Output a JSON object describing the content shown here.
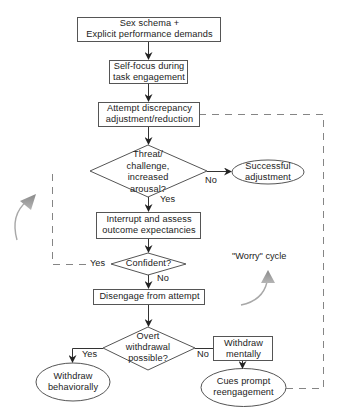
{
  "diagram": {
    "type": "flowchart",
    "colors": {
      "stroke": "#555555",
      "text": "#222222",
      "cycle_arrow": "#9a9a9a",
      "background": "#ffffff"
    },
    "nodes": {
      "sex_schema": {
        "shape": "rect",
        "lines": [
          "Sex schema +",
          "Explicit performance demands"
        ]
      },
      "self_focus": {
        "shape": "rect",
        "lines": [
          "Self-focus during",
          "task engagement"
        ]
      },
      "attempt": {
        "shape": "rect",
        "lines": [
          "Attempt discrepancy",
          "adjustment/reduction"
        ]
      },
      "threat": {
        "shape": "diamond",
        "lines": [
          "Threat/",
          "challenge,",
          "increased",
          "arousal?"
        ]
      },
      "successful": {
        "shape": "ellipse",
        "lines": [
          "Successful",
          "adjustment"
        ]
      },
      "interrupt": {
        "shape": "rect",
        "lines": [
          "Interrupt and assess",
          "outcome expectancies"
        ]
      },
      "confident": {
        "shape": "diamond",
        "lines": [
          "Confident?"
        ]
      },
      "disengage": {
        "shape": "rect",
        "lines": [
          "Disengage from attempt"
        ]
      },
      "overt": {
        "shape": "diamond",
        "lines": [
          "Overt",
          "withdrawal",
          "possible?"
        ]
      },
      "withdraw_behaviorally": {
        "shape": "ellipse",
        "lines": [
          "Withdraw",
          "behaviorally"
        ]
      },
      "withdraw_mentally": {
        "shape": "rect",
        "lines": [
          "Withdraw",
          "mentally"
        ]
      },
      "cues": {
        "shape": "ellipse",
        "lines": [
          "Cues prompt",
          "reengagement"
        ]
      }
    },
    "edge_labels": {
      "threat_no": "No",
      "threat_yes": "Yes",
      "confident_yes": "Yes",
      "confident_no": "No",
      "overt_yes": "Yes",
      "overt_no": "No"
    },
    "annotations": {
      "worry_cycle": "\"Worry\" cycle"
    },
    "edges": [
      {
        "from": "sex_schema",
        "to": "self_focus",
        "style": "solid"
      },
      {
        "from": "self_focus",
        "to": "attempt",
        "style": "solid"
      },
      {
        "from": "attempt",
        "to": "threat",
        "style": "solid"
      },
      {
        "from": "threat",
        "to": "successful",
        "label": "No",
        "style": "solid"
      },
      {
        "from": "threat",
        "to": "interrupt",
        "label": "Yes",
        "style": "solid"
      },
      {
        "from": "interrupt",
        "to": "confident",
        "style": "solid"
      },
      {
        "from": "confident",
        "to": "attempt",
        "label": "Yes",
        "style": "dashed"
      },
      {
        "from": "confident",
        "to": "disengage",
        "label": "No",
        "style": "solid"
      },
      {
        "from": "disengage",
        "to": "overt",
        "style": "solid"
      },
      {
        "from": "overt",
        "to": "withdraw_behaviorally",
        "label": "Yes",
        "style": "solid"
      },
      {
        "from": "overt",
        "to": "withdraw_mentally",
        "label": "No",
        "style": "solid"
      },
      {
        "from": "withdraw_mentally",
        "to": "cues",
        "style": "solid"
      },
      {
        "from": "cues",
        "to": "attempt",
        "style": "dashed"
      }
    ]
  }
}
